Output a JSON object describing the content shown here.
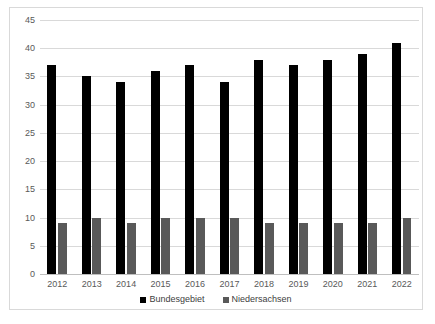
{
  "chart_data": {
    "type": "bar",
    "title": "",
    "subtitle": "",
    "xlabel": "",
    "ylabel": "",
    "categories": [
      "2012",
      "2013",
      "2014",
      "2015",
      "2016",
      "2017",
      "2018",
      "2019",
      "2020",
      "2021",
      "2022"
    ],
    "series": [
      {
        "name": "Bundesgebiet",
        "color": "#000000",
        "values": [
          37,
          35,
          34,
          36,
          37,
          34,
          38,
          37,
          38,
          39,
          41
        ]
      },
      {
        "name": "Niedersachsen",
        "color": "#595959",
        "values": [
          9,
          10,
          9,
          10,
          10,
          10,
          9,
          9,
          9,
          9,
          10
        ]
      }
    ],
    "ylim": [
      0,
      45
    ],
    "ytick_step": 5,
    "yticks": [
      "0",
      "5",
      "10",
      "15",
      "20",
      "25",
      "30",
      "35",
      "40",
      "45"
    ],
    "grid": true,
    "grid_color": "#d9d9d9",
    "legend_position": "bottom-center",
    "background": "#ffffff",
    "border_color": "#d9d9d9"
  }
}
